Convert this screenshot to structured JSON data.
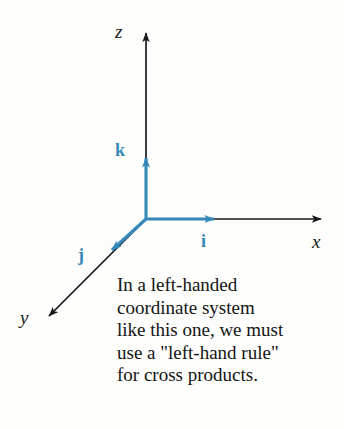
{
  "figure": {
    "name": "left-handed-coordinate-system-diagram",
    "background_color": "#fdfdfb",
    "axis_color": "#1a1a1a",
    "vector_color": "#3489b8"
  },
  "axes": [
    {
      "id": "z",
      "label": "z",
      "direction": "up",
      "from": [
        146,
        219
      ],
      "to": [
        146,
        26
      ]
    },
    {
      "id": "x",
      "label": "x",
      "direction": "right",
      "from": [
        146,
        219
      ],
      "to": [
        328,
        219
      ]
    },
    {
      "id": "y",
      "label": "y",
      "direction": "down-left",
      "from": [
        146,
        219
      ],
      "to": [
        43,
        322
      ]
    }
  ],
  "vectors": [
    {
      "id": "k",
      "label": "k",
      "from": [
        146,
        219
      ],
      "to": [
        146,
        150
      ]
    },
    {
      "id": "i",
      "label": "i",
      "from": [
        146,
        219
      ],
      "to": [
        222,
        219
      ]
    },
    {
      "id": "j",
      "label": "j",
      "from": [
        146,
        219
      ],
      "to": [
        106,
        256
      ]
    }
  ],
  "caption": {
    "lines": [
      "In a left-handed",
      "coordinate system",
      "like this one, we must",
      "use a \"left-hand rule\"",
      "for cross products."
    ],
    "line_1": "In a left-handed",
    "line_2": "coordinate system",
    "line_3": "like this one, we must",
    "line_4": "use a \"left-hand rule\"",
    "line_5": "for cross products."
  }
}
